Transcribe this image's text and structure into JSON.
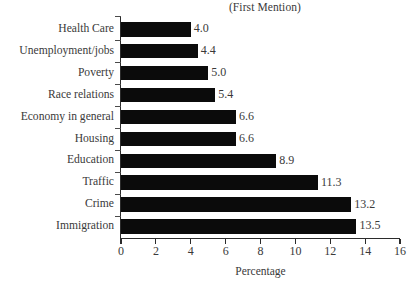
{
  "chart_data": {
    "type": "bar",
    "orientation": "horizontal",
    "title": "(First Mention)",
    "xlabel": "Percentage",
    "ylabel": "",
    "xlim": [
      0,
      16
    ],
    "xticks": [
      0,
      2,
      4,
      6,
      8,
      10,
      12,
      14,
      16
    ],
    "grid": false,
    "legend": null,
    "bar_color": "#0b0b0b",
    "background_color": "#ffffff",
    "categories": [
      "Health Care",
      "Unemployment/jobs",
      "Poverty",
      "Race relations",
      "Economy in general",
      "Housing",
      "Education",
      "Traffic",
      "Crime",
      "Immigration"
    ],
    "values": [
      4.0,
      4.4,
      5.0,
      5.4,
      6.6,
      6.6,
      8.9,
      11.3,
      13.2,
      13.5
    ],
    "value_labels": [
      "4.0",
      "4.4",
      "5.0",
      "5.4",
      "6.6",
      "6.6",
      "8.9",
      "11.3",
      "13.2",
      "13.5"
    ]
  }
}
